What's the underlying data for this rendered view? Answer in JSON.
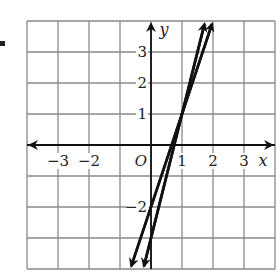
{
  "chart_data": {
    "type": "line",
    "title": "",
    "xlabel": "x",
    "ylabel": "y",
    "xlim": [
      -4,
      4
    ],
    "ylim": [
      -4,
      4
    ],
    "grid": true,
    "origin_label": "O",
    "x_tick_labels": [
      {
        "value": -3,
        "label": "−3"
      },
      {
        "value": -2,
        "label": "−2"
      },
      {
        "value": 1,
        "label": "1"
      },
      {
        "value": 2,
        "label": "2"
      },
      {
        "value": 3,
        "label": "3"
      }
    ],
    "y_tick_labels": [
      {
        "value": 3,
        "label": "3"
      },
      {
        "value": 2,
        "label": "2"
      },
      {
        "value": 1,
        "label": "1"
      },
      {
        "value": -2,
        "label": "−2"
      }
    ],
    "series": [
      {
        "name": "line 1",
        "equation": "y = 3x - 2",
        "x": [
          -0.667,
          2
        ],
        "y": [
          -4,
          4
        ]
      },
      {
        "name": "line 2",
        "equation": "y = 4x - 3",
        "x": [
          -0.25,
          1.75
        ],
        "y": [
          -4,
          4
        ]
      }
    ],
    "intersection": {
      "x": 1,
      "y": 1
    },
    "colors": {
      "grid": "#8a8a8a",
      "axis": "#111111",
      "line": "#111111"
    }
  }
}
